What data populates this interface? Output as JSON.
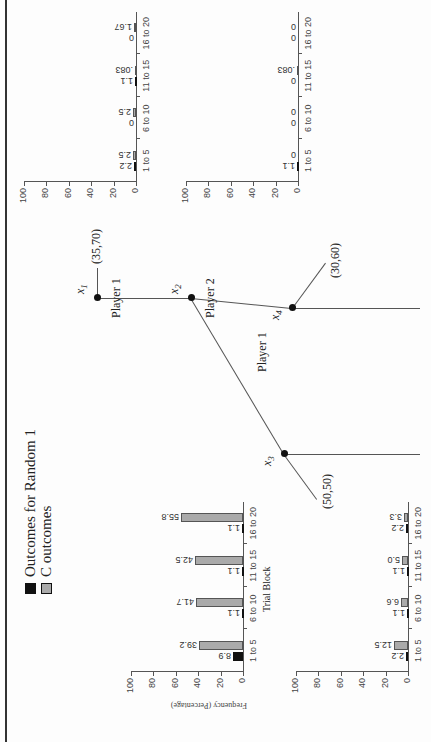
{
  "legend": {
    "items": [
      {
        "label": "Outcomes for Random 1",
        "color": "#111111"
      },
      {
        "label": "C outcomes",
        "color": "#aaaaaa"
      }
    ]
  },
  "tree": {
    "nodes": [
      {
        "id": "x1",
        "label": "x",
        "sub": "1",
        "player": "Player 1"
      },
      {
        "id": "x2",
        "label": "x",
        "sub": "2",
        "player": "Player 2"
      },
      {
        "id": "x3",
        "label": "x",
        "sub": "3",
        "player": ""
      },
      {
        "id": "x4",
        "label": "x",
        "sub": "4",
        "player": ""
      }
    ],
    "player_bottom": "Player 1",
    "payoffs": {
      "x1": "(35,70)",
      "x3": "(50,50)",
      "x4": "(30,60)"
    }
  },
  "chart_data": [
    {
      "type": "bar",
      "position": "top-left",
      "categories": [
        "1 to 5",
        "6 to 10",
        "11 to 15",
        "16 to 20"
      ],
      "series": [
        {
          "name": "Outcomes for Random 1",
          "values": [
            8.9,
            1.1,
            1.1,
            1.1
          ],
          "labels": [
            "8.9",
            "1.1",
            "1.1",
            "1.1"
          ]
        },
        {
          "name": "C outcomes",
          "values": [
            39.2,
            41.7,
            42.5,
            55.8
          ],
          "labels": [
            "39.2",
            "41.7",
            "42.5",
            "55.8"
          ]
        }
      ],
      "xlabel": "Trial Block",
      "ylabel": "Frequency (Percentage)",
      "yticks": [
        "0",
        "20",
        "40",
        "60",
        "80",
        "100"
      ],
      "ylim": [
        0,
        100
      ]
    },
    {
      "type": "bar",
      "position": "bottom-left",
      "categories": [
        "1 to 5",
        "6 to 10",
        "11 to 15",
        "16 to 20"
      ],
      "series": [
        {
          "name": "Outcomes for Random 1",
          "values": [
            2.2,
            1.1,
            1.1,
            2.2
          ],
          "labels": [
            "2.2",
            "1.1",
            "1.1",
            "2.2"
          ]
        },
        {
          "name": "C outcomes",
          "values": [
            12.5,
            6.6,
            5.0,
            3.3
          ],
          "labels": [
            "12.5",
            "6.6",
            "5.0",
            "3.3"
          ]
        }
      ],
      "xlabel": "",
      "ylabel": "",
      "yticks": [
        "0",
        "20",
        "40",
        "60",
        "80",
        "100"
      ],
      "ylim": [
        0,
        100
      ]
    },
    {
      "type": "bar",
      "position": "top-right",
      "categories": [
        "1 to 5",
        "6 to 10",
        "11 to 15",
        "16 to 20"
      ],
      "series": [
        {
          "name": "Outcomes for Random 1",
          "values": [
            2.2,
            0,
            1.1,
            0
          ],
          "labels": [
            "2.2",
            "0",
            "1.1",
            "0"
          ]
        },
        {
          "name": "C outcomes",
          "values": [
            2.5,
            2.5,
            0.83,
            1.67
          ],
          "labels": [
            "2.5",
            "2.5",
            ".083",
            "1.67"
          ]
        }
      ],
      "xlabel": "",
      "ylabel": "",
      "yticks": [
        "0",
        "20",
        "40",
        "60",
        "80",
        "100"
      ],
      "ylim": [
        0,
        100
      ]
    },
    {
      "type": "bar",
      "position": "bottom-right",
      "categories": [
        "1 to 5",
        "6 to 10",
        "11 to 15",
        "16 to 20"
      ],
      "series": [
        {
          "name": "Outcomes for Random 1",
          "values": [
            1.1,
            0,
            0,
            0
          ],
          "labels": [
            "1.1",
            "0",
            "0",
            "0"
          ]
        },
        {
          "name": "C outcomes",
          "values": [
            0,
            0,
            0.83,
            0
          ],
          "labels": [
            "0",
            "0",
            ".083",
            "0"
          ]
        }
      ],
      "xlabel": "",
      "ylabel": "",
      "yticks": [
        "0",
        "20",
        "40",
        "60",
        "80",
        "100"
      ],
      "ylim": [
        0,
        100
      ]
    }
  ]
}
